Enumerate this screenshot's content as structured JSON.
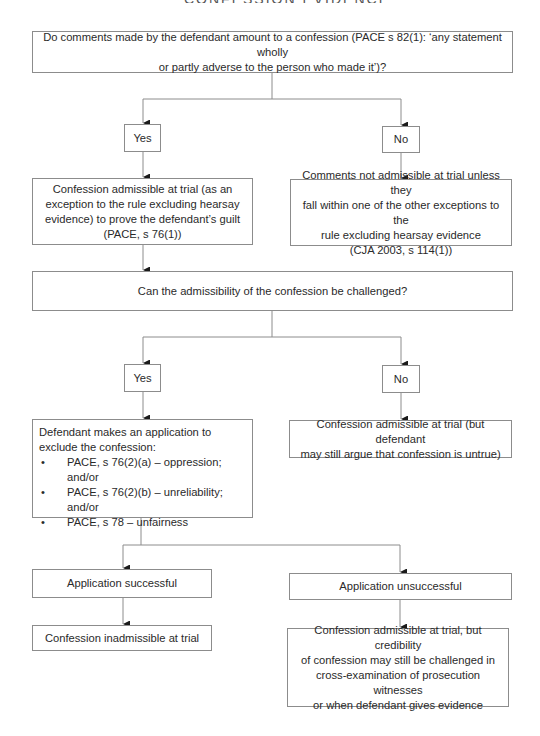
{
  "header": {
    "running_title_partial": "CONFESSION EVIDENCE"
  },
  "nodes": {
    "q1": {
      "text": "Do comments made by the defendant amount to a confession (PACE s 82(1): ‘any statement wholly\nor partly adverse to the person who made it’)?"
    },
    "q1_yes": {
      "text": "Yes"
    },
    "q1_no": {
      "text": "No"
    },
    "yes_result": {
      "text": "Confession admissible at trial (as an\nexception to the rule excluding hearsay\nevidence) to prove the defendant’s guilt\n(PACE, s 76(1))"
    },
    "no_result": {
      "text": "Comments not admissible at trial unless they\nfall within one of the other exceptions to the\nrule excluding hearsay evidence\n(CJA 2003, s 114(1))"
    },
    "q2": {
      "text": "Can the admissibility of the confession be challenged?"
    },
    "q2_yes": {
      "text": "Yes"
    },
    "q2_no": {
      "text": "No"
    },
    "application": {
      "intro": "Defendant makes an application to exclude the confession:",
      "bullets": [
        "PACE, s 76(2)(a) – oppression; and/or",
        "PACE, s 76(2)(b) – unreliability; and/or",
        "PACE, s 78 – unfairness"
      ]
    },
    "q2_no_result": {
      "text": "Confession admissible at trial (but defendant\nmay still argue that confession is untrue)"
    },
    "app_success": {
      "text": "Application successful"
    },
    "app_fail": {
      "text": "Application unsuccessful"
    },
    "success_result": {
      "text": "Confession inadmissible at trial"
    },
    "fail_result": {
      "text": "Confession admissible at trial, but credibility\nof confession may still be challenged in\ncross-examination of prosecution witnesses\nor when defendant gives evidence"
    }
  },
  "colors": {
    "line": "#8c8c8c",
    "arrow": "#1a1a1a",
    "border": "#8c8c8c"
  }
}
